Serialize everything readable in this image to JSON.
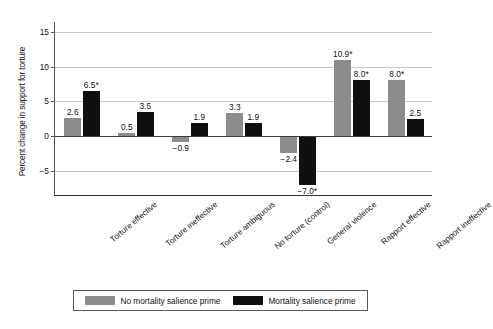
{
  "chart_data": {
    "type": "bar",
    "title": "",
    "xlabel": "",
    "ylabel": "Percent change in support for torture",
    "ylim": [
      -8.6,
      16.4
    ],
    "yticks": [
      15,
      10,
      5,
      0,
      -5
    ],
    "ytick_labels": [
      "15",
      "10",
      "5",
      "0",
      "−5"
    ],
    "grid": true,
    "legend_position": "bottom",
    "categories": [
      "Torture effective",
      "Torture ineffective",
      "Torture ambiguous",
      "No torture (control)",
      "General violence",
      "Rapport effective",
      "Rapport ineffective"
    ],
    "series": [
      {
        "name": "No mortality salience prime",
        "color": "#8c8c8c",
        "values": [
          2.6,
          0.5,
          -0.9,
          3.3,
          -2.4,
          10.9,
          8.0
        ],
        "labels": [
          "2.6",
          "0.5",
          "−0.9",
          "3.3",
          "−2.4",
          "10.9*",
          "8.0*"
        ]
      },
      {
        "name": "Mortality salience prime",
        "color": "#101010",
        "values": [
          6.5,
          3.5,
          1.9,
          1.9,
          -7.0,
          8.0,
          2.5
        ],
        "labels": [
          "6.5*",
          "3.5",
          "1.9",
          "1.9",
          "−7.0*",
          "8.0*",
          "2.5"
        ]
      }
    ]
  },
  "legend": {
    "items": [
      {
        "label": "No mortality salience prime",
        "swatch": "gray"
      },
      {
        "label": "Mortality salience prime",
        "swatch": "black"
      }
    ]
  }
}
